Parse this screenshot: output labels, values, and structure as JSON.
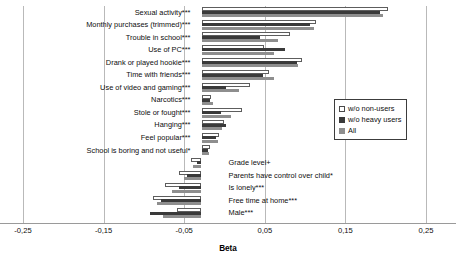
{
  "chart_data": {
    "type": "bar",
    "orientation": "horizontal",
    "title": "",
    "xlabel": "Beta",
    "ylabel": "",
    "xlim": [
      -0.25,
      0.25
    ],
    "xticks": [
      -0.25,
      -0.15,
      -0.05,
      0.05,
      0.15,
      0.25
    ],
    "xticklabels": [
      "-0,25",
      "-0,15",
      "-0,05",
      "0,05",
      "0,15",
      "0,25"
    ],
    "grid": true,
    "legend_position": "right",
    "categories": [
      "Sexual activity***",
      "Monthly purchases (trimmed)***",
      "Trouble in school***",
      "Use of PC***",
      "Drank or played hookie***",
      "Time with friends***",
      "Use of video and gaming***",
      "Narcotics***",
      "Stole or fought***",
      "Hanging***",
      "Feel popular***",
      "School is boring and not useful*",
      "Grade level+",
      "Parents have control over child*",
      "Is lonely***",
      "Free time at home***",
      "Male***"
    ],
    "series": [
      {
        "name": "w/o non-users",
        "values": [
          0.232,
          0.142,
          0.11,
          0.078,
          0.125,
          0.084,
          0.06,
          0.012,
          0.05,
          0.028,
          0.022,
          0.01,
          -0.013,
          -0.028,
          -0.045,
          -0.06,
          -0.03
        ]
      },
      {
        "name": "w/o heavy users",
        "values": [
          0.222,
          0.135,
          0.072,
          0.103,
          0.118,
          0.076,
          0.03,
          0.011,
          0.024,
          0.03,
          0.018,
          0.008,
          -0.006,
          -0.018,
          -0.028,
          -0.05,
          -0.064
        ]
      },
      {
        "name": "All",
        "values": [
          0.225,
          0.14,
          0.095,
          0.09,
          0.12,
          0.09,
          0.046,
          0.014,
          0.036,
          0.026,
          0.02,
          0.009,
          -0.01,
          -0.022,
          -0.036,
          -0.055,
          -0.048
        ]
      }
    ],
    "legend": [
      "w/o non-users",
      "w/o heavy users",
      "All"
    ],
    "colors": {
      "w/o non-users": "#ffffff",
      "w/o heavy users": "#3a3a3a",
      "All": "#8e8e8e",
      "grid": "#b9b9b9",
      "axis": "#9a9a9a",
      "text": "#0d0d0d"
    }
  }
}
